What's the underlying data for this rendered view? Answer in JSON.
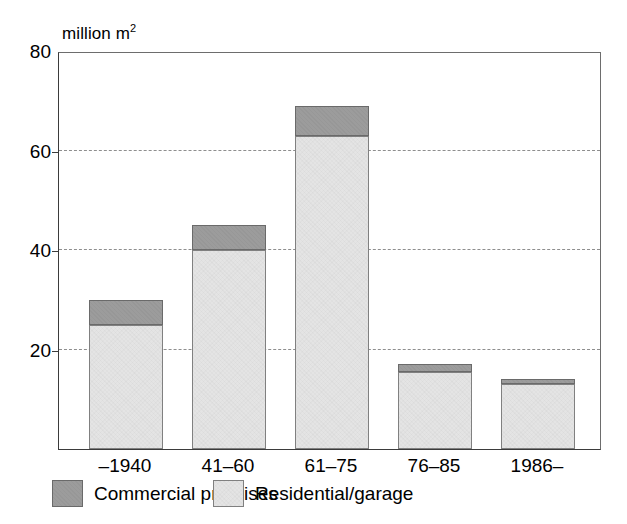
{
  "chart_data": {
    "type": "bar",
    "stacked": true,
    "title": "",
    "subtitle": "",
    "xlabel": "",
    "ylabel": "million m2",
    "ylabel_display": "million m",
    "ylabel_superscript": "2",
    "categories": [
      "–1940",
      "41–60",
      "61–75",
      "76–85",
      "1986–"
    ],
    "series": [
      {
        "name": "Residential/garage",
        "color": "#e4e4e4",
        "values": [
          25,
          40,
          63,
          15.5,
          13
        ]
      },
      {
        "name": "Commercial premises",
        "color": "#9c9c9c",
        "values": [
          5,
          5,
          6,
          1.5,
          1
        ]
      }
    ],
    "totals": [
      30,
      45,
      69,
      17,
      14
    ],
    "stack_order": [
      "Residential/garage",
      "Commercial premises"
    ],
    "ylim": [
      0,
      80
    ],
    "yticks": [
      20,
      40,
      60,
      80
    ],
    "ytick_labels": [
      "20",
      "40",
      "60",
      "80"
    ],
    "gridlines_at": [
      20,
      40,
      60
    ],
    "grid": true,
    "grid_style": "dashed",
    "legend_position": "bottom-left"
  },
  "legend": {
    "entries": [
      {
        "label": "Commercial premises",
        "swatch": "commercial"
      },
      {
        "label": "Residential/garage",
        "swatch": "residential"
      }
    ]
  },
  "axis": {
    "unit_text": "million m",
    "unit_superscript": "2"
  }
}
